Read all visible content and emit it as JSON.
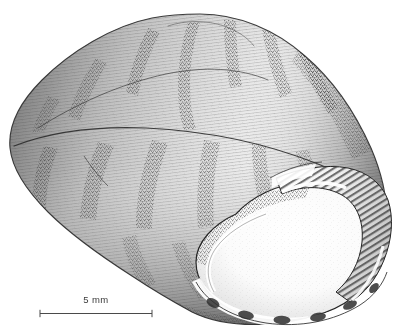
{
  "figure": {
    "domain": "scientific-illustration",
    "view": "apertural oblique view",
    "technique": "pen-and-ink stipple and hatch drawing",
    "background_color": "#ffffff",
    "ink_color": "#2b2b2b",
    "midtone_color": "#6f6f6f",
    "page_number": "",
    "scale_bar": {
      "label": "5 mm",
      "length_px": 112,
      "value": 5,
      "unit": "mm",
      "x_start_px": 40,
      "x_end_px": 152,
      "y_px": 312
    },
    "anatomy": [
      {
        "name": "apex",
        "label": "apex",
        "x": 200,
        "y": 16
      },
      {
        "name": "spire",
        "label": "spire",
        "x": 150,
        "y": 70
      },
      {
        "name": "suture",
        "label": "suture",
        "x": 170,
        "y": 75
      },
      {
        "name": "body-whorl",
        "label": "body whorl",
        "x": 180,
        "y": 170
      },
      {
        "name": "aperture",
        "label": "aperture",
        "x": 290,
        "y": 250
      },
      {
        "name": "columella",
        "label": "columella",
        "x": 330,
        "y": 200
      },
      {
        "name": "outer-lip",
        "label": "outer lip",
        "x": 370,
        "y": 255
      },
      {
        "name": "basal-lip",
        "label": "basal lip",
        "x": 270,
        "y": 315
      },
      {
        "name": "parietal-callus",
        "label": "parietal callus",
        "x": 300,
        "y": 190
      }
    ],
    "color_bands": {
      "description": "dark oblique axial bands on whorls",
      "count": 11,
      "color": "#4a4a4a"
    }
  }
}
